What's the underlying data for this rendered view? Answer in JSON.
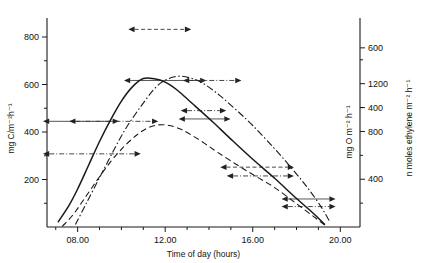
{
  "chart_data": {
    "type": "line",
    "title": "",
    "xlabel": "Time of day (hours)",
    "xticklabels": [
      "08.00",
      "12.00",
      "16.00",
      "20.00"
    ],
    "xtickvalues": [
      8,
      12,
      16,
      20
    ],
    "xlim": [
      6.6,
      20.9
    ],
    "grid": false,
    "legend": "none",
    "axes": [
      {
        "id": "left",
        "position": "left",
        "label": "mg C/m⁻²h⁻¹",
        "ticklabels": [
          "200",
          "400",
          "600",
          "800"
        ],
        "tickvalues": [
          200,
          400,
          600,
          800
        ],
        "ylim": [
          0,
          880
        ],
        "minor_ticks": [
          100,
          300,
          500,
          700
        ]
      },
      {
        "id": "right-inner",
        "position": "right",
        "label": "mg O m⁻² h⁻¹",
        "ticklabels": [
          "400",
          "800",
          "1200"
        ],
        "tickvalues": [
          400,
          800,
          1200
        ],
        "ylim": [
          0,
          1750
        ],
        "minor_ticks": [
          200,
          600,
          1000,
          1400
        ]
      },
      {
        "id": "right-outer",
        "position": "right",
        "label": "n moles ethylene m⁻² h⁻¹",
        "ticklabels": [
          "400",
          "600"
        ],
        "tickvalues": [
          400,
          600
        ],
        "ylim": [
          0,
          700
        ]
      }
    ],
    "series": [
      {
        "name": "carbon-fixation",
        "style": "solid",
        "axis": "left",
        "units": "mg C/m⁻²h⁻¹",
        "peak_value": 625,
        "peak_time": 11.0,
        "x": [
          7.1,
          7.6,
          8.0,
          8.5,
          9.0,
          9.5,
          10.0,
          10.5,
          11.0,
          11.5,
          12.0,
          12.5,
          13.0,
          13.6,
          14.2,
          15.0,
          16.0,
          17.0,
          18.0,
          18.8,
          19.3
        ],
        "y": [
          20,
          90,
          160,
          260,
          360,
          450,
          530,
          590,
          625,
          624,
          610,
          580,
          540,
          490,
          440,
          370,
          285,
          205,
          120,
          55,
          10
        ]
      },
      {
        "name": "oxygen-evolution",
        "style": "dashed",
        "axis": "right-inner",
        "units": "mg O m⁻² h⁻¹",
        "peak_value": 855,
        "peak_time": 11.7,
        "x": [
          7.3,
          7.8,
          8.3,
          8.9,
          9.5,
          10.1,
          10.7,
          11.2,
          11.7,
          12.2,
          12.7,
          13.2,
          13.8,
          14.4,
          15.2,
          16.0,
          17.0,
          18.0,
          18.8,
          19.3
        ],
        "y": [
          5,
          105,
          235,
          395,
          545,
          670,
          770,
          830,
          855,
          850,
          820,
          770,
          700,
          625,
          530,
          440,
          330,
          195,
          85,
          15
        ]
      },
      {
        "name": "ethylene-reduction",
        "style": "dashdot",
        "axis": "right-outer",
        "units": "n moles ethylene m⁻² h⁻¹",
        "peak_value": 505,
        "peak_time": 12.6,
        "x": [
          7.9,
          8.4,
          9.0,
          9.6,
          10.2,
          10.9,
          11.5,
          12.0,
          12.6,
          13.2,
          13.8,
          14.5,
          15.2,
          16.0,
          17.0,
          17.8,
          18.5,
          19.1,
          19.5
        ],
        "y": [
          8,
          80,
          165,
          250,
          330,
          405,
          462,
          492,
          505,
          498,
          478,
          440,
          395,
          340,
          262,
          195,
          132,
          70,
          20
        ]
      }
    ],
    "annotations": [
      {
        "name": "ann-solid-left-low",
        "style": "solid",
        "x1": 6.7,
        "x2": 9.6,
        "value": 445,
        "axis": "left",
        "arrows": "both"
      },
      {
        "name": "ann-dashdot-left-low",
        "style": "dashdot",
        "x1": 7.9,
        "x2": 11.4,
        "value": 445,
        "axis": "left",
        "arrows": "both"
      },
      {
        "name": "ann-dashdot-left-lower",
        "style": "dashdot",
        "x1": 6.7,
        "x2": 10.6,
        "value": 308,
        "axis": "left",
        "arrows": "both"
      },
      {
        "name": "ann-solid-peak",
        "style": "solid",
        "x1": 10.4,
        "x2": 13.6,
        "value": 617,
        "axis": "left",
        "arrows": "both"
      },
      {
        "name": "ann-dashdot-peak-right",
        "style": "dashdot",
        "x1": 13.1,
        "x2": 15.2,
        "value": 617,
        "axis": "left",
        "arrows": "both"
      },
      {
        "name": "ann-dashed-peak",
        "style": "dashed",
        "x1": 10.6,
        "x2": 12.9,
        "value": 1655,
        "axis": "right-inner",
        "arrows": "both"
      },
      {
        "name": "ann-dashdot-mid-right",
        "style": "dashdot",
        "x1": 13.0,
        "x2": 14.5,
        "value": 490,
        "axis": "left",
        "arrows": "both"
      },
      {
        "name": "ann-solid-mid-right",
        "style": "solid",
        "x1": 12.9,
        "x2": 14.7,
        "value": 455,
        "axis": "left",
        "arrows": "both"
      },
      {
        "name": "ann-dashed-desc",
        "style": "dashed",
        "x1": 14.8,
        "x2": 17.6,
        "value": 252,
        "axis": "left",
        "arrows": "both"
      },
      {
        "name": "ann-dashdot-desc",
        "style": "dashdot",
        "x1": 15.1,
        "x2": 17.6,
        "value": 215,
        "axis": "left",
        "arrows": "both"
      },
      {
        "name": "ann-solid-tail",
        "style": "solid",
        "x1": 17.6,
        "x2": 19.5,
        "value": 118,
        "axis": "left",
        "arrows": "both"
      },
      {
        "name": "ann-dashdot-tail",
        "style": "dashdot",
        "x1": 17.6,
        "x2": 19.5,
        "value": 86,
        "axis": "left",
        "arrows": "both"
      }
    ]
  }
}
